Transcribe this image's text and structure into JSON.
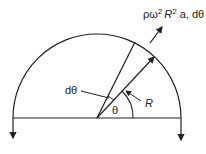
{
  "diagram": {
    "type": "free-body diagram of rotating semicircular ring",
    "labels": {
      "force": "ρω² R² a, dθ",
      "force_main": "ρω",
      "force_sup1": "2",
      "force_r": "R",
      "force_sup2": "2",
      "force_rest": " a, dθ",
      "element_angle": "dθ",
      "angle": "θ",
      "radius": "R"
    },
    "colors": {
      "stroke": "#222222",
      "background": "#ffffff"
    }
  }
}
